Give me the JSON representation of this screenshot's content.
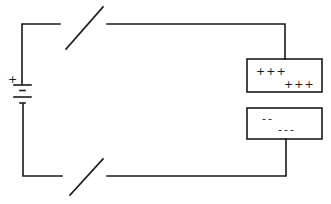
{
  "diagram": {
    "type": "circuit",
    "battery": {
      "positive_label": "+",
      "negative_label": "-"
    },
    "switches": [
      {
        "name": "top-switch",
        "state": "open"
      },
      {
        "name": "bottom-switch",
        "state": "open"
      }
    ],
    "capacitor": {
      "top_plate": {
        "line1": "+++",
        "line2": "+++"
      },
      "bottom_plate": {
        "line1": "--",
        "line2": "---"
      }
    }
  }
}
